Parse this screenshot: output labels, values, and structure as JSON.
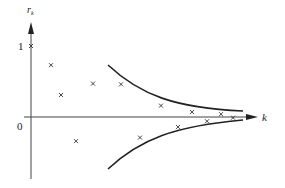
{
  "chart_data": {
    "type": "scatter",
    "title": "",
    "xlabel": "k",
    "ylabel": "r_k",
    "y_ticks": [
      "1",
      "0"
    ],
    "grid": false,
    "legend": null,
    "points": [
      {
        "x": 0,
        "y": 1.0
      },
      {
        "x": 1,
        "y": 0.73
      },
      {
        "x": 2,
        "y": 0.31
      },
      {
        "x": 3,
        "y": -0.34
      },
      {
        "x": 4,
        "y": 0.47
      },
      {
        "x": 5,
        "y": 0.46
      },
      {
        "x": 6,
        "y": -0.29
      },
      {
        "x": 7,
        "y": 0.16
      },
      {
        "x": 8,
        "y": -0.14
      },
      {
        "x": 9,
        "y": 0.07
      },
      {
        "x": 10,
        "y": -0.06
      },
      {
        "x": 11,
        "y": 0.04
      },
      {
        "x": 12,
        "y": -0.01
      }
    ],
    "envelope": {
      "description": "Decaying confidence bounds (upper and lower curves) converging toward zero as k increases",
      "upper_start": 0.73,
      "lower_start": -0.73,
      "asymptote": 0
    }
  },
  "labels": {
    "y_axis": "r",
    "y_axis_sub": "k",
    "x_axis": "k",
    "tick_one": "1",
    "tick_zero": "0"
  }
}
